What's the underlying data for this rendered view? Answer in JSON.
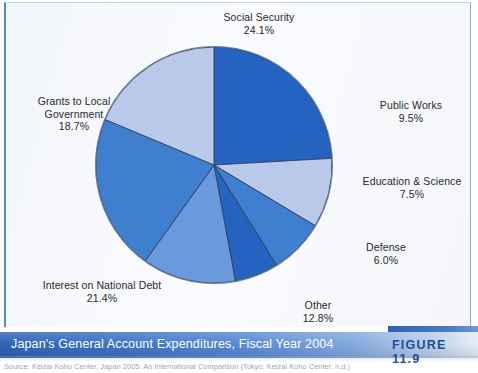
{
  "figure": {
    "caption": "Japan's General Account Expenditures, Fiscal Year 2004",
    "number_label": "FIGURE 11.9",
    "source": "Source: Keizai Koho Center, Japan 2005: An International Comparison (Tokyo: Keizai Koho Center, n.d.)"
  },
  "chart_data": {
    "type": "pie",
    "title": "Japan's General Account Expenditures, Fiscal Year 2004",
    "xlabel": "",
    "ylabel": "",
    "unit": "percent",
    "legend_position": "none",
    "labels_outside": true,
    "start_angle_deg": 0,
    "direction": "clockwise",
    "categories": [
      "Social Security",
      "Public Works",
      "Education & Science",
      "Defense",
      "Other",
      "Interest on National Debt",
      "Grants to Local Government"
    ],
    "values": [
      24.1,
      9.5,
      7.5,
      6.0,
      12.8,
      21.4,
      18.7
    ],
    "value_labels": [
      "24.1%",
      "9.5%",
      "7.5%",
      "6.0%",
      "12.8%",
      "21.4%",
      "18.7%"
    ],
    "colors": [
      "#2463bf",
      "#b9c9e9",
      "#3f7fd0",
      "#2463bf",
      "#6a9add",
      "#3f7fd0",
      "#b9c9e9"
    ],
    "slices": [
      {
        "name": "Social Security",
        "value": 24.1,
        "label": "Social Security",
        "pct": "24.1%",
        "color": "#2463bf"
      },
      {
        "name": "Public Works",
        "value": 9.5,
        "label": "Public Works",
        "pct": "9.5%",
        "color": "#b9c9e9"
      },
      {
        "name": "Education & Science",
        "value": 7.5,
        "label": "Education & Science",
        "pct": "7.5%",
        "color": "#3f7fd0"
      },
      {
        "name": "Defense",
        "value": 6.0,
        "label": "Defense",
        "pct": "6.0%",
        "color": "#2463bf"
      },
      {
        "name": "Other",
        "value": 12.8,
        "label": "Other",
        "pct": "12.8%",
        "color": "#6a9add"
      },
      {
        "name": "Interest on National Debt",
        "value": 21.4,
        "label": "Interest on National Debt",
        "pct": "21.4%",
        "color": "#3f7fd0"
      },
      {
        "name": "Grants to Local Government",
        "value": 18.7,
        "label": "Grants to Local\nGovernment",
        "pct": "18.7%",
        "color": "#b9c9e9"
      }
    ]
  },
  "labels": {
    "social_security": {
      "line1": "Social Security",
      "pct": "24.1%"
    },
    "public_works": {
      "line1": "Public Works",
      "pct": "9.5%"
    },
    "education_science": {
      "line1": "Education & Science",
      "pct": "7.5%"
    },
    "defense": {
      "line1": "Defense",
      "pct": "6.0%"
    },
    "other": {
      "line1": "Other",
      "pct": "12.8%"
    },
    "interest_debt": {
      "line1": "Interest on National Debt",
      "pct": "21.4%"
    },
    "grants_local": {
      "line1": "Grants to Local",
      "line2": "Government",
      "pct": "18.7%"
    }
  },
  "palette": {
    "dark_blue": "#2463bf",
    "medium_blue": "#3f7fd0",
    "light_medium_blue": "#6a9add",
    "light_blue": "#b9c9e9",
    "caption_blue": "#2f63b5",
    "panel_bg": "#f6f8fc",
    "text": "#2a2a2a"
  }
}
